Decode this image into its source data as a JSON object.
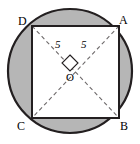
{
  "figure": {
    "type": "geometry-diagram",
    "width": 140,
    "height": 144,
    "colors": {
      "shaded_segment": "#b6b6b6",
      "square_fill": "#ffffff",
      "stroke": "#231f20",
      "dashed_stroke": "#6e6a6b",
      "background": "#ffffff"
    },
    "circle": {
      "center_x": 70,
      "center_y": 71,
      "radius": 62,
      "stroke_width": 2.2
    },
    "square": {
      "stroke_width": 2.0,
      "vertices": [
        {
          "name": "D",
          "label": "D",
          "x": 32,
          "y": 26,
          "label_x": 18,
          "label_y": 15
        },
        {
          "name": "A",
          "label": "A",
          "x": 119,
          "y": 26,
          "label_x": 119,
          "label_y": 14
        },
        {
          "name": "B",
          "label": "B",
          "x": 119,
          "y": 118,
          "label_x": 120,
          "label_y": 120
        },
        {
          "name": "C",
          "label": "C",
          "x": 32,
          "y": 118,
          "label_x": 17,
          "label_y": 120
        }
      ]
    },
    "diagonals": [
      {
        "name": "diagonal-D-B",
        "x1": 32,
        "y1": 26,
        "x2": 119,
        "y2": 118
      },
      {
        "name": "diagonal-A-C",
        "x1": 119,
        "y1": 26,
        "x2": 32,
        "y2": 118
      }
    ],
    "measures": [
      {
        "name": "radius-left",
        "value": "5",
        "x": 55,
        "y": 39
      },
      {
        "name": "radius-right",
        "value": "5",
        "x": 81,
        "y": 39
      }
    ],
    "center_point": {
      "name": "O",
      "label": "O",
      "x": 70,
      "y": 71,
      "label_x": 66,
      "label_y": 72
    },
    "right_angle_marker": {
      "name": "right-angle-marker",
      "shape": "diamond",
      "center_x": 70,
      "center_y": 63,
      "half_size": 8
    }
  }
}
